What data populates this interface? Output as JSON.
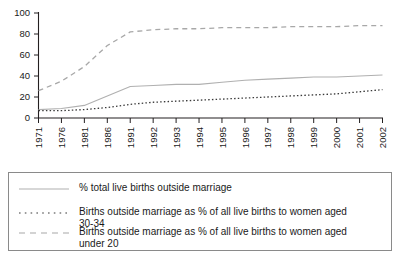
{
  "chart_data": {
    "type": "line",
    "title": "",
    "subtitle": "",
    "xlabel": "",
    "ylabel": "",
    "ylim": [
      0,
      100
    ],
    "yticks": [
      0,
      20,
      40,
      60,
      80,
      100
    ],
    "grid": false,
    "legend_position": "below",
    "categories": [
      "1971",
      "1976",
      "1981",
      "1986",
      "1991",
      "1992",
      "1993",
      "1994",
      "1995",
      "1996",
      "1997",
      "1998",
      "1999",
      "2000",
      "2001",
      "2002"
    ],
    "series": [
      {
        "name": "% total live births outside marriage",
        "style": "solid",
        "color": "#b0b0b0",
        "values": [
          8,
          9,
          12,
          21,
          30,
          31,
          32,
          32,
          34,
          36,
          37,
          38,
          39,
          39,
          40,
          41
        ]
      },
      {
        "name": "Births outside marriage as % of all live births to women aged 30-34",
        "style": "dotted",
        "color": "#3a3a3a",
        "values": [
          7,
          7,
          8,
          10,
          13,
          15,
          16,
          17,
          18,
          19,
          20,
          21,
          22,
          23,
          25,
          27
        ]
      },
      {
        "name": "Births outside marriage as % of all live births to women aged under 20",
        "style": "dashed",
        "color": "#a8a8a8",
        "values": [
          26,
          35,
          49,
          69,
          82,
          84,
          85,
          85,
          86,
          86,
          86,
          87,
          87,
          87,
          88,
          88
        ]
      }
    ]
  },
  "axes": {
    "y_tick_labels": [
      "100",
      "80",
      "60",
      "40",
      "20",
      "0"
    ],
    "x_tick_labels": [
      "1971",
      "1976",
      "1981",
      "1986",
      "1991",
      "1992",
      "1993",
      "1994",
      "1995",
      "1996",
      "1997",
      "1998",
      "1999",
      "2000",
      "2001",
      "2002"
    ]
  },
  "legend": {
    "entries": [
      {
        "label": "% total live births outside marriage",
        "style": "solid",
        "color": "#b0b0b0"
      },
      {
        "label": "Births outside marriage as % of all live births to women aged\n30-34",
        "style": "dotted",
        "color": "#3a3a3a"
      },
      {
        "label": "Births outside marriage as % of all live births to women aged\nunder 20",
        "style": "dashed",
        "color": "#a8a8a8"
      }
    ]
  },
  "colors": {
    "axis": "#231f20",
    "legend_border": "#8a8a8a",
    "background": "#ffffff",
    "solid_series": "#b0b0b0",
    "dotted_series": "#3a3a3a",
    "dashed_series": "#a8a8a8"
  }
}
